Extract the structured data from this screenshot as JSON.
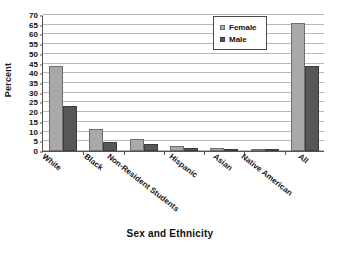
{
  "chart_data": {
    "type": "bar",
    "title": "",
    "xlabel": "Sex and Ethnicity",
    "ylabel": "Percent",
    "categories": [
      "White",
      "Black",
      "Non-Resident  Students",
      "Hispanic",
      "Asian",
      "Native American",
      "All"
    ],
    "series": [
      {
        "name": "Female",
        "color": "#a9a9a9",
        "values": [
          44,
          11.5,
          6,
          2.8,
          1.8,
          0.3,
          66
        ]
      },
      {
        "name": "Male",
        "color": "#575757",
        "values": [
          23,
          4.5,
          3.5,
          1.3,
          0.7,
          0.3,
          44
        ]
      }
    ],
    "ylim": [
      0,
      70
    ],
    "yticks": [
      0,
      5,
      10,
      15,
      20,
      25,
      30,
      35,
      40,
      45,
      50,
      55,
      60,
      65,
      70
    ],
    "grid": true,
    "legend_position": "top-right"
  },
  "legend": {
    "items": [
      {
        "label": "Female"
      },
      {
        "label": "Male"
      }
    ]
  }
}
